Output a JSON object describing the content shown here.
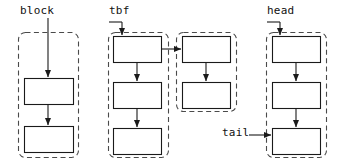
{
  "diagram": {
    "background": "#ffffff",
    "stroke_color": "#1a1a1a",
    "dash_color": "#4a4a4a",
    "box_fill": "#ffffff",
    "width": 345,
    "height": 164,
    "labels": [
      {
        "id": "block",
        "text": "block",
        "x": 20,
        "y": 4
      },
      {
        "id": "tbf",
        "text": "tbf",
        "x": 109,
        "y": 4
      },
      {
        "id": "head",
        "text": "head",
        "x": 267,
        "y": 4
      },
      {
        "id": "tail",
        "text": "tail",
        "x": 222,
        "y": 126
      }
    ],
    "groups": [
      {
        "id": "group-block",
        "label": "block",
        "x": 18,
        "y": 32,
        "w": 60,
        "h": 125,
        "rx": 7,
        "boxes": [
          {
            "id": "block-box-1",
            "x": 24,
            "y": 78,
            "w": 49,
            "h": 26
          },
          {
            "id": "block-box-2",
            "x": 24,
            "y": 126,
            "w": 49,
            "h": 26
          }
        ]
      },
      {
        "id": "group-tbf",
        "label": "tbf",
        "x": 108,
        "y": 32,
        "w": 60,
        "h": 125,
        "rx": 7,
        "boxes": [
          {
            "id": "tbf-box-1",
            "x": 113,
            "y": 36,
            "w": 48,
            "h": 26
          },
          {
            "id": "tbf-box-2",
            "x": 113,
            "y": 82,
            "w": 48,
            "h": 26
          },
          {
            "id": "tbf-box-3",
            "x": 113,
            "y": 128,
            "w": 48,
            "h": 26
          }
        ]
      },
      {
        "id": "group-mid-right",
        "label": "",
        "x": 176,
        "y": 32,
        "w": 60,
        "h": 79,
        "rx": 7,
        "boxes": [
          {
            "id": "mid-box-1",
            "x": 182,
            "y": 36,
            "w": 48,
            "h": 26
          },
          {
            "id": "mid-box-2",
            "x": 182,
            "y": 82,
            "w": 48,
            "h": 26
          }
        ]
      },
      {
        "id": "group-head",
        "label": "head",
        "x": 266,
        "y": 32,
        "w": 60,
        "h": 125,
        "rx": 7,
        "boxes": [
          {
            "id": "head-box-1",
            "x": 272,
            "y": 36,
            "w": 48,
            "h": 26
          },
          {
            "id": "head-box-2",
            "x": 272,
            "y": 82,
            "w": 48,
            "h": 26
          },
          {
            "id": "head-box-3",
            "x": 272,
            "y": 128,
            "w": 48,
            "h": 26
          }
        ]
      }
    ],
    "arrows": [
      {
        "id": "arrow-block-entry",
        "kind": "vertical",
        "from": [
          48,
          18
        ],
        "to": [
          48,
          77
        ]
      },
      {
        "id": "arrow-block-1-to-2",
        "kind": "vertical",
        "from": [
          48,
          104
        ],
        "to": [
          48,
          125
        ]
      },
      {
        "id": "arrow-tbf-entry",
        "kind": "vertical",
        "from": [
          122,
          22
        ],
        "to": [
          122,
          35
        ]
      },
      {
        "id": "arrow-tbf-1-to-2",
        "kind": "vertical",
        "from": [
          137,
          62
        ],
        "to": [
          137,
          81
        ]
      },
      {
        "id": "arrow-tbf-2-to-3",
        "kind": "vertical",
        "from": [
          137,
          108
        ],
        "to": [
          137,
          127
        ]
      },
      {
        "id": "arrow-tbf-to-mid",
        "kind": "horizontal",
        "from": [
          161,
          49
        ],
        "to": [
          181,
          49
        ]
      },
      {
        "id": "arrow-mid-1-to-2",
        "kind": "vertical",
        "from": [
          206,
          62
        ],
        "to": [
          206,
          81
        ]
      },
      {
        "id": "arrow-head-entry",
        "kind": "vertical",
        "from": [
          280,
          22
        ],
        "to": [
          280,
          35
        ]
      },
      {
        "id": "arrow-head-1-to-2",
        "kind": "vertical",
        "from": [
          296,
          62
        ],
        "to": [
          296,
          81
        ]
      },
      {
        "id": "arrow-head-2-to-3",
        "kind": "vertical",
        "from": [
          296,
          108
        ],
        "to": [
          296,
          127
        ]
      },
      {
        "id": "arrow-tail-entry",
        "kind": "horizontal",
        "from": [
          249,
          135
        ],
        "to": [
          271,
          135
        ]
      }
    ],
    "connector_lines": [
      {
        "id": "tbf-label-elbow",
        "points": "109,22 122,22"
      },
      {
        "id": "head-label-elbow",
        "points": "267,22 280,22"
      }
    ]
  }
}
